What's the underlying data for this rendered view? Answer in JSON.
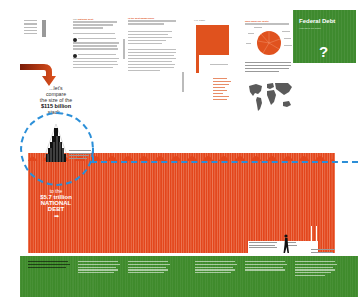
{
  "page": {
    "title": "Federal Debt",
    "subtitle": "How big is our debt?",
    "question_mark": "?"
  },
  "colors": {
    "accent_orange": "#e0521e",
    "debt_red": "#e3461c",
    "green": "#3e8a2e",
    "dashed_blue": "#2b8fd8"
  },
  "compare": {
    "line1": "...let's",
    "line2": "compare",
    "line3": "the size of the",
    "line4": "$115 billion",
    "line5": "stack..."
  },
  "national_debt": {
    "line1": "to the",
    "line2": "$5.7 trillion",
    "line3": "NATIONAL",
    "line4": "DEBT",
    "arrow": "➡"
  },
  "intro": {
    "heading_prefix": "The",
    "heading_highlight": "National Debt",
    "bullet_1": "1",
    "bullet_2": "2"
  },
  "side_column": {
    "heading": "Is the debt dangerous?"
  },
  "grid_chart": {
    "title": "U.S. DEBT",
    "caption": "",
    "note": ""
  },
  "pie_chart": {
    "title": "Who owns our debt?"
  },
  "icons": {
    "arrow": "curved-arrow-icon",
    "person": "person-walking-icon",
    "world_map": "world-map-icon",
    "stack": "money-stack-icon"
  }
}
